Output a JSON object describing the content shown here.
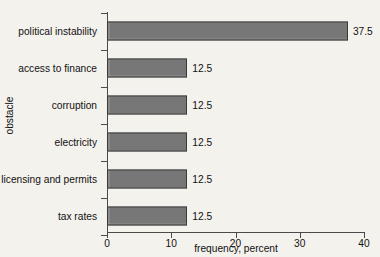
{
  "chart_data": {
    "type": "bar",
    "orientation": "horizontal",
    "title": "",
    "title_note": "title clipped off top edge of screenshot, not legible",
    "categories": [
      "political instability",
      "access to finance",
      "corruption",
      "electricity",
      "licensing and permits",
      "tax rates"
    ],
    "values": [
      37.5,
      12.5,
      12.5,
      12.5,
      12.5,
      12.5
    ],
    "value_labels": [
      "37.5",
      "12.5",
      "12.5",
      "12.5",
      "12.5",
      "12.5"
    ],
    "xlabel": "frequency, percent",
    "ylabel": "obstacle",
    "xlim": [
      0,
      40
    ],
    "xticks": [
      0,
      10,
      20,
      30,
      40
    ],
    "xtick_labels": [
      "0",
      "10",
      "20",
      "30",
      "40"
    ],
    "grid": false,
    "legend": false,
    "bar_color": "#828282",
    "bar_border_color": "#3a3a3a",
    "background_color": "#f4f2ed",
    "axis_color": "#4a4a4a"
  }
}
